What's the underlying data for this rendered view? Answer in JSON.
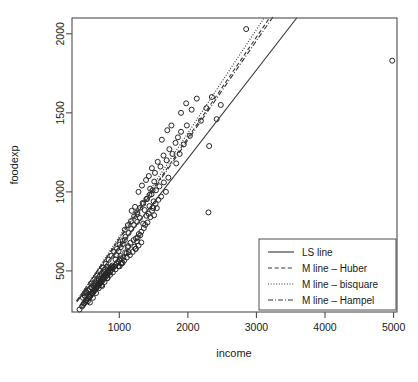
{
  "chart_data": {
    "type": "scatter",
    "title": "",
    "xlabel": "income",
    "ylabel": "foodexp",
    "xlim": [
      310,
      5050
    ],
    "ylim": [
      240,
      2100
    ],
    "xticks": [
      1000,
      2000,
      3000,
      4000,
      5000
    ],
    "yticks": [
      500,
      1000,
      1500,
      2000
    ],
    "xtick_labels": [
      "1000",
      "2000",
      "3000",
      "4000",
      "5000"
    ],
    "ytick_labels": [
      "500",
      "1000",
      "1500",
      "2000"
    ],
    "grid": false,
    "marker": "open-circle",
    "legend_position": "bottom-right",
    "points": [
      [
        420,
        256
      ],
      [
        541,
        308
      ],
      [
        901,
        522
      ],
      [
        639,
        404
      ],
      [
        750,
        405
      ],
      [
        945,
        572
      ],
      [
        829,
        454
      ],
      [
        1004,
        529
      ],
      [
        1086,
        617
      ],
      [
        1015,
        594
      ],
      [
        1026,
        550
      ],
      [
        1059,
        584
      ],
      [
        1047,
        550
      ],
      [
        1123,
        649
      ],
      [
        1129,
        657
      ],
      [
        1107,
        613
      ],
      [
        1138,
        618
      ],
      [
        1164,
        678
      ],
      [
        1208,
        695
      ],
      [
        1220,
        653
      ],
      [
        1242,
        706
      ],
      [
        1237,
        639
      ],
      [
        1256,
        687
      ],
      [
        1284,
        733
      ],
      [
        1270,
        712
      ],
      [
        1306,
        726
      ],
      [
        1321,
        748
      ],
      [
        1348,
        799
      ],
      [
        1357,
        771
      ],
      [
        1377,
        791
      ],
      [
        1396,
        849
      ],
      [
        1411,
        806
      ],
      [
        1428,
        861
      ],
      [
        1452,
        840
      ],
      [
        1477,
        880
      ],
      [
        1493,
        898
      ],
      [
        1508,
        852
      ],
      [
        1529,
        924
      ],
      [
        1547,
        897
      ],
      [
        1570,
        950
      ],
      [
        482,
        293
      ],
      [
        518,
        312
      ],
      [
        560,
        334
      ],
      [
        577,
        340
      ],
      [
        598,
        356
      ],
      [
        612,
        362
      ],
      [
        628,
        374
      ],
      [
        640,
        386
      ],
      [
        655,
        394
      ],
      [
        668,
        401
      ],
      [
        680,
        410
      ],
      [
        691,
        415
      ],
      [
        703,
        420
      ],
      [
        714,
        429
      ],
      [
        726,
        435
      ],
      [
        737,
        441
      ],
      [
        749,
        447
      ],
      [
        760,
        456
      ],
      [
        772,
        462
      ],
      [
        783,
        468
      ],
      [
        795,
        475
      ],
      [
        806,
        481
      ],
      [
        818,
        489
      ],
      [
        829,
        494
      ],
      [
        841,
        501
      ],
      [
        852,
        508
      ],
      [
        864,
        515
      ],
      [
        875,
        520
      ],
      [
        887,
        527
      ],
      [
        898,
        534
      ],
      [
        455,
        275
      ],
      [
        470,
        284
      ],
      [
        490,
        296
      ],
      [
        505,
        305
      ],
      [
        525,
        317
      ],
      [
        545,
        326
      ],
      [
        565,
        338
      ],
      [
        585,
        347
      ],
      [
        605,
        359
      ],
      [
        625,
        369
      ],
      [
        645,
        380
      ],
      [
        665,
        390
      ],
      [
        685,
        402
      ],
      [
        705,
        411
      ],
      [
        725,
        423
      ],
      [
        745,
        432
      ],
      [
        765,
        444
      ],
      [
        785,
        453
      ],
      [
        805,
        465
      ],
      [
        825,
        474
      ],
      [
        845,
        486
      ],
      [
        865,
        495
      ],
      [
        885,
        507
      ],
      [
        905,
        516
      ],
      [
        925,
        528
      ],
      [
        945,
        537
      ],
      [
        965,
        549
      ],
      [
        985,
        558
      ],
      [
        1005,
        570
      ],
      [
        1025,
        579
      ],
      [
        500,
        340
      ],
      [
        520,
        365
      ],
      [
        545,
        378
      ],
      [
        570,
        300
      ],
      [
        590,
        420
      ],
      [
        615,
        330
      ],
      [
        635,
        445
      ],
      [
        660,
        360
      ],
      [
        680,
        470
      ],
      [
        700,
        390
      ],
      [
        720,
        500
      ],
      [
        740,
        410
      ],
      [
        765,
        520
      ],
      [
        785,
        430
      ],
      [
        805,
        545
      ],
      [
        825,
        455
      ],
      [
        845,
        570
      ],
      [
        865,
        475
      ],
      [
        885,
        595
      ],
      [
        905,
        490
      ],
      [
        925,
        620
      ],
      [
        945,
        510
      ],
      [
        965,
        640
      ],
      [
        985,
        530
      ],
      [
        1005,
        665
      ],
      [
        1030,
        545
      ],
      [
        1050,
        690
      ],
      [
        1070,
        565
      ],
      [
        1090,
        715
      ],
      [
        1110,
        585
      ],
      [
        1135,
        740
      ],
      [
        1155,
        600
      ],
      [
        1175,
        765
      ],
      [
        1195,
        620
      ],
      [
        1215,
        790
      ],
      [
        1240,
        640
      ],
      [
        1260,
        810
      ],
      [
        1280,
        660
      ],
      [
        1300,
        835
      ],
      [
        1320,
        680
      ],
      [
        1180,
        880
      ],
      [
        1230,
        905
      ],
      [
        1265,
        860
      ],
      [
        1340,
        930
      ],
      [
        1370,
        885
      ],
      [
        1405,
        955
      ],
      [
        1440,
        910
      ],
      [
        1470,
        985
      ],
      [
        1500,
        940
      ],
      [
        1535,
        1010
      ],
      [
        1585,
        1035
      ],
      [
        1610,
        970
      ],
      [
        1650,
        1060
      ],
      [
        1680,
        1000
      ],
      [
        1715,
        1090
      ],
      [
        1430,
        1100
      ],
      [
        1475,
        1150
      ],
      [
        1520,
        1120
      ],
      [
        1560,
        1190
      ],
      [
        1600,
        1160
      ],
      [
        1645,
        1230
      ],
      [
        1690,
        1200
      ],
      [
        1730,
        1270
      ],
      [
        1775,
        1240
      ],
      [
        1820,
        1310
      ],
      [
        1280,
        1000
      ],
      [
        1330,
        1040
      ],
      [
        1390,
        1075
      ],
      [
        1450,
        1020
      ],
      [
        1510,
        1065
      ],
      [
        1855,
        1345
      ],
      [
        1900,
        1380
      ],
      [
        1940,
        1300
      ],
      [
        1985,
        1420
      ],
      [
        2030,
        1355
      ],
      [
        1900,
        1500
      ],
      [
        1975,
        1560
      ],
      [
        2055,
        1520
      ],
      [
        2130,
        1590
      ],
      [
        2190,
        1450
      ],
      [
        2270,
        1530
      ],
      [
        2310,
        1290
      ],
      [
        2350,
        1600
      ],
      [
        2420,
        1460
      ],
      [
        2480,
        1550
      ],
      [
        1620,
        1330
      ],
      [
        1700,
        1390
      ],
      [
        1760,
        1420
      ],
      [
        1830,
        1180
      ],
      [
        1880,
        1240
      ],
      [
        2300,
        870
      ],
      [
        2850,
        2030
      ],
      [
        4980,
        1830
      ],
      [
        1080,
        760
      ],
      [
        1125,
        790
      ],
      [
        1170,
        815
      ],
      [
        1215,
        845
      ],
      [
        1260,
        870
      ],
      [
        1305,
        900
      ],
      [
        1350,
        925
      ],
      [
        1395,
        955
      ],
      [
        1440,
        980
      ],
      [
        1485,
        1010
      ],
      [
        960,
        600
      ],
      [
        990,
        625
      ],
      [
        1020,
        650
      ],
      [
        1050,
        670
      ],
      [
        1080,
        695
      ],
      [
        720,
        465
      ],
      [
        745,
        480
      ],
      [
        770,
        495
      ],
      [
        795,
        510
      ],
      [
        820,
        525
      ],
      [
        600,
        395
      ],
      [
        625,
        408
      ],
      [
        650,
        422
      ],
      [
        675,
        435
      ],
      [
        700,
        449
      ],
      [
        470,
        330
      ],
      [
        495,
        345
      ],
      [
        520,
        358
      ],
      [
        545,
        372
      ],
      [
        570,
        385
      ]
    ],
    "series_lines": [
      {
        "name": "LS line",
        "style": "solid",
        "intercept": 91,
        "slope": 0.56,
        "x_from": 380,
        "x_to": 3590
      },
      {
        "name": "M line – Huber",
        "style": "dashed",
        "intercept": 68,
        "slope": 0.637,
        "x_from": 380,
        "x_to": 3190
      },
      {
        "name": "M line – bisquare",
        "style": "dotted",
        "intercept": 62,
        "slope": 0.655,
        "x_from": 380,
        "x_to": 3110
      },
      {
        "name": "M line – Hampel",
        "style": "dashdot",
        "intercept": 72,
        "slope": 0.628,
        "x_from": 380,
        "x_to": 3240
      }
    ],
    "legend": {
      "entries": [
        {
          "label": "LS line",
          "style": "solid"
        },
        {
          "label": "M line – Huber",
          "style": "dashed"
        },
        {
          "label": "M line – bisquare",
          "style": "dotted"
        },
        {
          "label": "M line – Hampel",
          "style": "dashdot"
        }
      ]
    },
    "colors": {
      "axis": "#4d4d4d",
      "text": "#1a1a1a",
      "point": "#262626",
      "line": "#333333",
      "background": "#ffffff"
    }
  }
}
